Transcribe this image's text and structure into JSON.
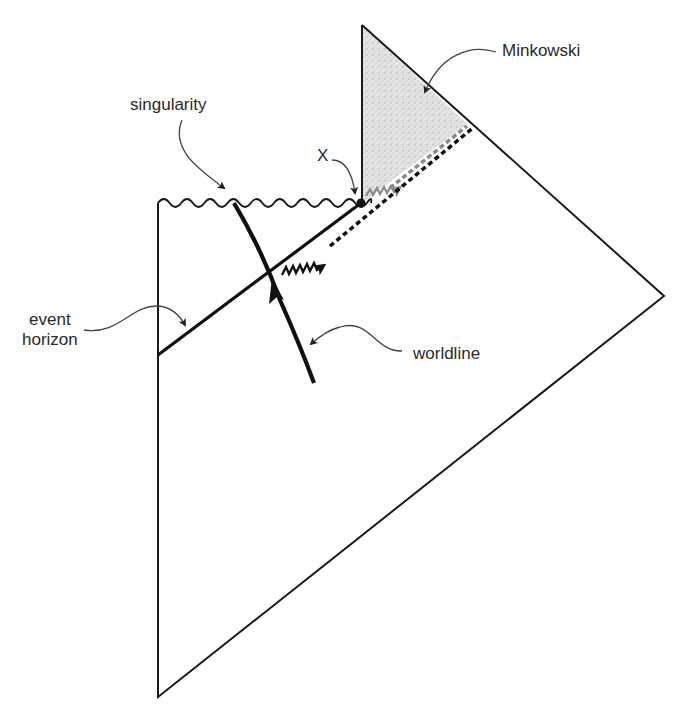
{
  "labels": {
    "minkowski": "Minkowski",
    "singularity": "singularity",
    "x_point": "X",
    "event_horizon_line1": "event",
    "event_horizon_line2": "horizon",
    "worldline": "worldline"
  },
  "colors": {
    "line": "#1a1a1a",
    "label_text": "#2a2a2a",
    "leader": "#444444",
    "shaded_region": "#d8d8d8",
    "gray_dash": "#8a8a8a"
  },
  "geometry": {
    "outer_boundary": [
      [
        158,
        203
      ],
      [
        158,
        697
      ],
      [
        664,
        296
      ],
      [
        362,
        25
      ]
    ],
    "minkowski_region": [
      [
        362,
        25
      ],
      [
        467,
        124
      ],
      [
        362,
        203
      ]
    ],
    "x_point": [
      361,
      203
    ],
    "event_horizon": [
      [
        158,
        355
      ],
      [
        361,
        203
      ]
    ],
    "singularity_wavy": [
      [
        158,
        203
      ],
      [
        361,
        203
      ]
    ],
    "worldline": [
      [
        234,
        203
      ],
      [
        272,
        272
      ],
      [
        314,
        383
      ]
    ],
    "photon_wavy": [
      [
        282,
        273
      ],
      [
        327,
        248
      ]
    ],
    "photon_dotted": [
      [
        327,
        248
      ],
      [
        473,
        127
      ]
    ],
    "gray_dashed": [
      [
        380,
        196
      ],
      [
        467,
        124
      ]
    ]
  }
}
